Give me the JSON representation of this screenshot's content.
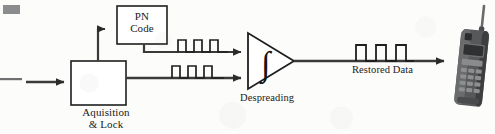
{
  "figure": {
    "blocks": [
      {
        "id": "pn_code",
        "label_lines": [
          "PN",
          "Code"
        ]
      },
      {
        "id": "acquisition",
        "label_lines": [
          "Aquisition",
          "& Lock"
        ]
      }
    ],
    "labels": {
      "despreading": "Despreading",
      "restored_data": "Restored Data"
    },
    "signals": [
      {
        "id": "pn_chip_stream",
        "pulses": 3,
        "description": "square-wave pulse train on PN code path"
      },
      {
        "id": "received_signal",
        "pulses": 3,
        "description": "square-wave pulse train on received signal path"
      },
      {
        "id": "restored_data",
        "pulses": 3,
        "description": "square-wave pulse train on despread output"
      }
    ],
    "elements": {
      "integrator_symbol": "∫",
      "device": "mobile-handset"
    },
    "colors": {
      "ink": "#1a1a1a",
      "line": "#3a3a3a",
      "paper": "#fcfcfb",
      "phone_body": "#57585a",
      "phone_dark": "#2e2f31",
      "phone_screen": "#6d6e70"
    }
  }
}
